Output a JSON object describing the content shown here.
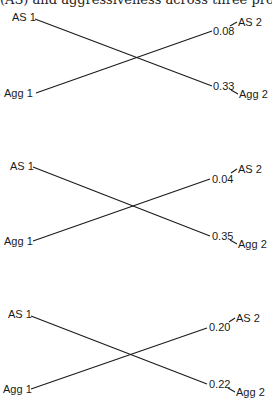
{
  "title": {
    "text": "(AS) and aggressiveness across three probe periods"
  },
  "panels": [
    {
      "id": "panel-1",
      "labels": {
        "as1": "AS 1",
        "agg1": "Agg 1",
        "as2": "AS 2",
        "agg2": "Agg 2"
      },
      "paths": {
        "agg1_to_as2": "0.08",
        "as1_to_agg2": "0.33"
      }
    },
    {
      "id": "panel-2",
      "labels": {
        "as1": "AS 1",
        "agg1": "Agg 1",
        "as2": "AS 2",
        "agg2": "Agg 2"
      },
      "paths": {
        "agg1_to_as2": "0.04",
        "as1_to_agg2": "0.35"
      }
    },
    {
      "id": "panel-3",
      "labels": {
        "as1": "AS 1",
        "agg1": "Agg 1",
        "as2": "AS 2",
        "agg2": "Agg 2"
      },
      "paths": {
        "agg1_to_as2": "0.20",
        "as1_to_agg2": "0.22"
      }
    }
  ]
}
